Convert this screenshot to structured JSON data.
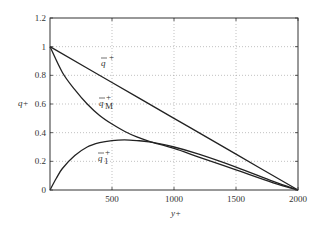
{
  "chart_data": {
    "type": "line",
    "title": "",
    "xlabel": "y+",
    "ylabel": "q+",
    "xlim": [
      0,
      2000
    ],
    "ylim": [
      0,
      1.2
    ],
    "grid": true,
    "xticks": [
      500,
      1000,
      1500,
      2000
    ],
    "yticks": [
      0,
      0.2,
      0.4,
      0.6,
      0.8,
      1,
      1.2
    ],
    "xtick_labels": [
      "500",
      "1000",
      "1500",
      "2000"
    ],
    "ytick_labels": [
      "0",
      "0.2",
      "0.4",
      "0.6",
      "0.8",
      "1",
      "1.2"
    ],
    "series": [
      {
        "name": "q̄+",
        "label_base": "q",
        "label_sub": "",
        "x": [
          0,
          500,
          1000,
          1500,
          2000
        ],
        "values": [
          1.0,
          0.75,
          0.5,
          0.25,
          0.0
        ]
      },
      {
        "name": "q̄M+",
        "label_base": "q",
        "label_sub": "M",
        "x": [
          0,
          100,
          200,
          300,
          400,
          500,
          600,
          700,
          800,
          1000,
          1200,
          1500,
          1800,
          2000
        ],
        "values": [
          1.0,
          0.82,
          0.7,
          0.6,
          0.52,
          0.46,
          0.41,
          0.37,
          0.34,
          0.29,
          0.23,
          0.14,
          0.05,
          0.0
        ]
      },
      {
        "name": "q̄1+",
        "label_base": "q",
        "label_sub": "1",
        "x": [
          0,
          50,
          100,
          200,
          300,
          400,
          500,
          600,
          700,
          800,
          1000,
          1200,
          1500,
          1800,
          2000
        ],
        "values": [
          0.0,
          0.08,
          0.15,
          0.24,
          0.3,
          0.33,
          0.345,
          0.35,
          0.345,
          0.335,
          0.3,
          0.25,
          0.16,
          0.06,
          0.0
        ]
      }
    ],
    "annotations": [
      {
        "text": "q̄+",
        "x": 700,
        "y": 0.88
      },
      {
        "text": "q̄M+",
        "x": 700,
        "y": 0.57
      },
      {
        "text": "q̄1+",
        "x": 700,
        "y": 0.2
      }
    ]
  }
}
